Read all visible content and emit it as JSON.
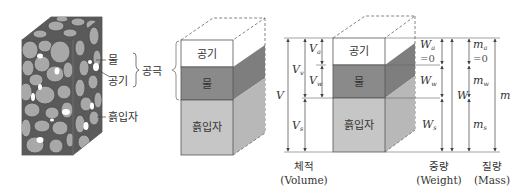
{
  "colors": {
    "air": "#ffffff",
    "water_front": "#8a8a8a",
    "water_side": "#7a7a7a",
    "solid_front": "#c6c6c6",
    "solid_side": "#b6b6b6",
    "line": "#555555",
    "text": "#333333"
  },
  "soil_sample": {
    "labels": {
      "water": "물",
      "air": "공기",
      "pore": "공극",
      "soil_particle": "흙입자"
    }
  },
  "phase_block": {
    "air": "공기",
    "water": "물",
    "solids": "흙입자"
  },
  "phase_diagram": {
    "air": "공기",
    "water": "물",
    "solids": "흙입자",
    "volume": {
      "total": "V",
      "voids": {
        "base": "V",
        "sub": "v"
      },
      "air": {
        "base": "V",
        "sub": "a"
      },
      "water": {
        "base": "V",
        "sub": "w"
      },
      "solids": {
        "base": "V",
        "sub": "s"
      },
      "caption_kr": "체적",
      "caption_en": "(Volume)"
    },
    "weight": {
      "total": "W",
      "air": {
        "base": "W",
        "sub": "a"
      },
      "air_value": "=0",
      "water": {
        "base": "W",
        "sub": "w"
      },
      "solids": {
        "base": "W",
        "sub": "s"
      },
      "caption_kr": "중량",
      "caption_en": "(Weight)"
    },
    "mass": {
      "total": "m",
      "air": {
        "base": "m",
        "sub": "a"
      },
      "air_value": "=0",
      "water": {
        "base": "m",
        "sub": "w"
      },
      "solids": {
        "base": "m",
        "sub": "s"
      },
      "caption_kr": "질량",
      "caption_en": "(Mass)"
    }
  }
}
